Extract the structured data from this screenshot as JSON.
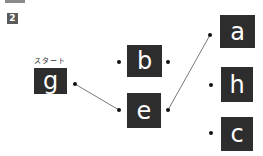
{
  "header": {
    "problem_number": "2"
  },
  "start_label": "スタート",
  "nodes": {
    "g": {
      "letter": "g"
    },
    "b": {
      "letter": "b"
    },
    "e": {
      "letter": "e"
    },
    "a": {
      "letter": "a"
    },
    "h": {
      "letter": "h"
    },
    "c": {
      "letter": "c"
    }
  },
  "connections": [
    {
      "from": "g",
      "to": "e"
    },
    {
      "from": "e",
      "to": "a"
    }
  ],
  "colors": {
    "box": "#2d2d2d",
    "text": "#ffffff",
    "line": "#555555",
    "badge": "#5a5a5a"
  }
}
